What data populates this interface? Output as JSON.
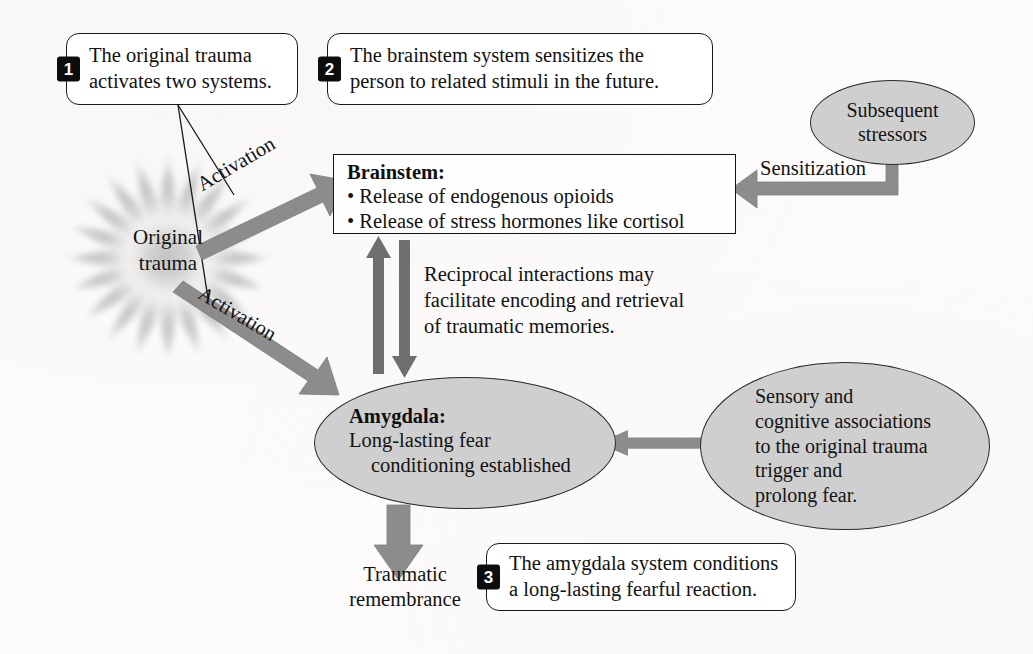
{
  "figure": {
    "type": "process-diagram",
    "colors": {
      "arrow_gray": "#8c8c8c",
      "shape_fill_gray": "#cfcfcf",
      "ink_black": "#121212",
      "badge_black": "#0d0d0d",
      "page_white": "#fdfcfb"
    }
  },
  "callouts": [
    {
      "number": "1",
      "text": "The original trauma\nactivates two systems."
    },
    {
      "number": "2",
      "text": "The brainstem system sensitizes the\nperson to related stimuli in the future."
    },
    {
      "number": "3",
      "text": "The amygdala system conditions\na long-lasting fearful reaction."
    }
  ],
  "nodes": {
    "original_trauma": {
      "shape": "starburst",
      "label": "Original\ntrauma"
    },
    "brainstem": {
      "shape": "rectangle",
      "title": "Brainstem:",
      "bullets": [
        "Release of endogenous opioids",
        "Release of stress hormones like cortisol"
      ]
    },
    "amygdala": {
      "shape": "ellipse",
      "title": "Amygdala:",
      "line1": "Long-lasting fear",
      "line2": "conditioning established"
    },
    "subsequent_stressors": {
      "shape": "ellipse",
      "label": "Subsequent\nstressors"
    },
    "associations": {
      "shape": "ellipse",
      "label": "Sensory and\ncognitive associations\nto the original trauma\ntrigger and\nprolong fear."
    },
    "traumatic_remembrance": {
      "shape": "text",
      "label": "Traumatic\nremembrance"
    }
  },
  "edges": {
    "activation_to_brainstem": "Activation",
    "activation_to_amygdala": "Activation",
    "sensitization": "Sensitization",
    "reciprocal": "Reciprocal interactions may\nfacilitate encoding and retrieval\nof traumatic memories."
  }
}
